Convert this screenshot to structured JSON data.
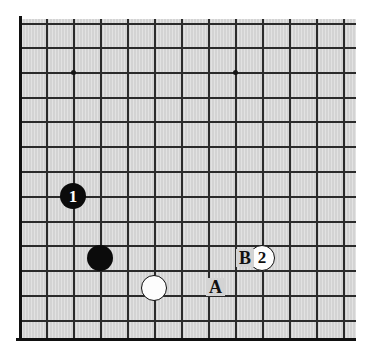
{
  "figure": {
    "name": "go-board-diagram",
    "type": "go-board",
    "board_color": "#d3d3d3",
    "line_color": "#2b2b2b",
    "edge_color": "#111111"
  },
  "board": {
    "visible_columns": 13,
    "visible_rows": 13,
    "left_edge_visible": true,
    "bottom_edge_visible": true,
    "top_edge_visible": false,
    "right_edge_visible": false,
    "column_x": [
      19,
      46,
      73,
      100,
      127,
      154,
      181,
      208,
      235,
      262,
      289,
      316,
      343
    ],
    "row_y": [
      23,
      47,
      72,
      97,
      121,
      146,
      171,
      196,
      221,
      245,
      270,
      295,
      320
    ],
    "star_points": [
      {
        "name": "star-point-left",
        "col": 2,
        "row": 2
      },
      {
        "name": "star-point-right",
        "col": 8,
        "row": 2
      }
    ]
  },
  "stones": [
    {
      "name": "black-stone-1",
      "color": "black",
      "label": "1",
      "col": 2,
      "row": 7,
      "radius": 13
    },
    {
      "name": "black-stone-plain",
      "color": "black",
      "label": "",
      "col": 3,
      "row": 9.5,
      "radius": 13
    },
    {
      "name": "white-stone-plain",
      "color": "white",
      "label": "",
      "col": 5,
      "row": 10.7,
      "radius": 13
    },
    {
      "name": "white-stone-2",
      "color": "white",
      "label": "2",
      "col": 9,
      "row": 9.5,
      "radius": 13
    }
  ],
  "markers": [
    {
      "name": "point-marker-a",
      "label": "A",
      "x": 206,
      "y": 287
    },
    {
      "name": "point-marker-b",
      "label": "B",
      "x": 236,
      "y": 258
    }
  ]
}
